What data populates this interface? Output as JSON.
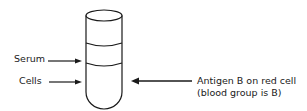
{
  "diagram": {
    "labels": {
      "serum": "Serum",
      "cells": "Cells",
      "antigen_line1": "Antigen B on red cell",
      "antigen_line2": "(blood group is B)"
    },
    "colors": {
      "stroke": "#1a1a1a",
      "background": "#ffffff"
    }
  }
}
